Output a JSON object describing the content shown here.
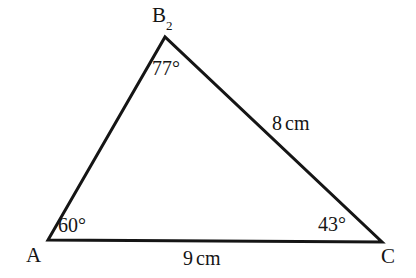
{
  "figure": {
    "kind": "triangle-diagram",
    "background_color": "#ffffff",
    "stroke_color": "#151515",
    "text_color": "#151515",
    "stroke_width": 3
  },
  "vertices": {
    "a": {
      "label": "A",
      "x": 48,
      "y": 240
    },
    "b": {
      "label": "B",
      "subscript": "2",
      "x": 165,
      "y": 37
    },
    "c": {
      "label": "C",
      "x": 382,
      "y": 242
    }
  },
  "angles": {
    "at_a": "60°",
    "at_b": "77°",
    "at_c": "43°"
  },
  "sides": {
    "ac": {
      "value": "9",
      "unit": "cm"
    },
    "bc": {
      "value": "8",
      "unit": "cm"
    },
    "ab": {
      "value": "",
      "unit": ""
    }
  }
}
